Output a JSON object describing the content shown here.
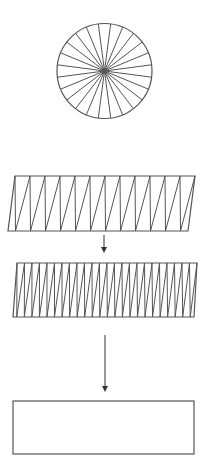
{
  "canvas": {
    "width": 207,
    "height": 472,
    "background": "#ffffff",
    "stroke": "#555555"
  },
  "diagram": {
    "circle": {
      "cx": 104.5,
      "cy": 71,
      "r": 47.5,
      "spokes": 24
    },
    "zigzag_1": {
      "top_y": 176,
      "bottom_y": 231,
      "top_left_x": 15,
      "top_right_x": 195,
      "bottom_left_x": 8,
      "bottom_right_x": 188,
      "teeth": 12
    },
    "arrow_1": {
      "x": 104,
      "y1": 235,
      "y2": 253
    },
    "zigzag_2": {
      "top_y": 263,
      "bottom_y": 317,
      "top_left_x": 17,
      "top_right_x": 197,
      "bottom_left_x": 13,
      "bottom_right_x": 194,
      "teeth": 24
    },
    "arrow_2": {
      "x": 105,
      "y1": 335,
      "y2": 392
    },
    "rectangle": {
      "x": 13,
      "y": 401,
      "width": 181,
      "height": 53
    }
  }
}
